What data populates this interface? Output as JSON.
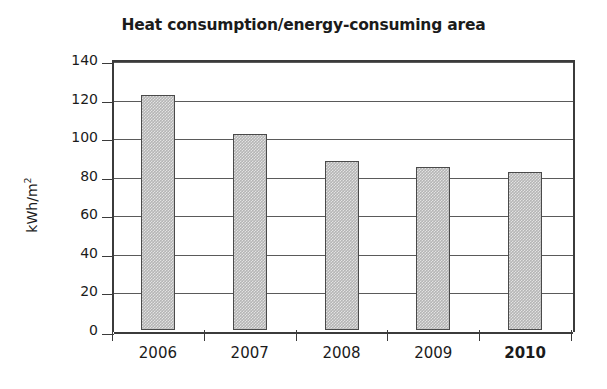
{
  "chart_data": {
    "type": "bar",
    "title": "Heat consumption/energy-consuming area",
    "xlabel": "",
    "ylabel": "kWh/m",
    "ylabel_superscript": "2",
    "categories": [
      "2006",
      "2007",
      "2008",
      "2009",
      "2010"
    ],
    "values": [
      122,
      101.5,
      87.5,
      84.5,
      82
    ],
    "ylim": [
      0,
      140
    ],
    "ytick_labels": [
      "0",
      "20",
      "40",
      "60",
      "80",
      "100",
      "120",
      "140"
    ],
    "ytick_values": [
      0,
      20,
      40,
      60,
      80,
      100,
      120,
      140
    ],
    "grid": true,
    "grid_orientation": "horizontal",
    "legend": null,
    "series": [
      {
        "name": "Heat consumption",
        "values": [
          122,
          101.5,
          87.5,
          84.5,
          82
        ]
      }
    ],
    "emphasis_category": "2010",
    "colors": {
      "bar_fill": "#b5b5b5",
      "bar_border": "#4a4a4a",
      "axis": "#3b3b3b",
      "gridline": "#5a5a5a",
      "text": "#1b1b1b",
      "background": "#ffffff"
    }
  }
}
